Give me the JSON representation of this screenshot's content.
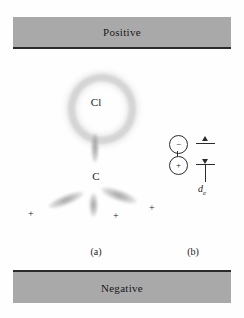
{
  "figure": {
    "background_color": "#fefefe",
    "plate_color": "#a9a9a9",
    "ink_color": "#1b1b1b"
  },
  "plates": {
    "top": {
      "label": "Positive",
      "name": "positive-electrode-plate"
    },
    "bottom": {
      "label": "Negative",
      "name": "negative-electrode-plate"
    }
  },
  "molecule": {
    "chlorine_label": "Cl",
    "carbon_label": "C",
    "hydrogen_marks": [
      "+",
      "+",
      "+"
    ]
  },
  "dipole": {
    "negative_charge": "−",
    "positive_charge": "+",
    "distance_symbol": "d",
    "distance_subscript": "e"
  },
  "captions": {
    "panel_a": "(a)",
    "panel_b": "(b)"
  }
}
